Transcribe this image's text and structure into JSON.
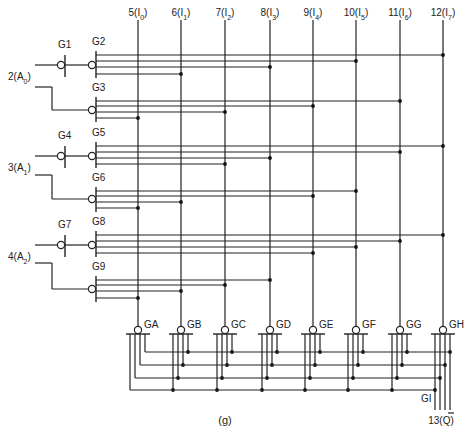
{
  "diagram": {
    "caption": "(g)",
    "type": "8-input multiplexer logic diagram",
    "colors": {
      "line": "#222222",
      "background": "#ffffff"
    }
  },
  "inputs_top": [
    {
      "pin": "5",
      "signal": "I",
      "sub": "0",
      "x": 138
    },
    {
      "pin": "6",
      "signal": "I",
      "sub": "1",
      "x": 181
    },
    {
      "pin": "7",
      "signal": "I",
      "sub": "2",
      "x": 225
    },
    {
      "pin": "8",
      "signal": "I",
      "sub": "3",
      "x": 270
    },
    {
      "pin": "9",
      "signal": "I",
      "sub": "4",
      "x": 313
    },
    {
      "pin": "10",
      "signal": "I",
      "sub": "5",
      "x": 356
    },
    {
      "pin": "11",
      "signal": "I",
      "sub": "6",
      "x": 400
    },
    {
      "pin": "12",
      "signal": "I",
      "sub": "7",
      "x": 443
    }
  ],
  "address_inputs": [
    {
      "pin": "2",
      "signal": "A",
      "sub": "0"
    },
    {
      "pin": "3",
      "signal": "A",
      "sub": "1"
    },
    {
      "pin": "4",
      "signal": "A",
      "sub": "2"
    }
  ],
  "inverter_gates": [
    "G1",
    "G4",
    "G7"
  ],
  "decoder_gates": [
    "G2",
    "G3",
    "G5",
    "G6",
    "G8",
    "G9"
  ],
  "output_gates": [
    "GA",
    "GB",
    "GC",
    "GD",
    "GE",
    "GF",
    "GG",
    "GH"
  ],
  "final_gate": "GI",
  "output": {
    "pin": "13",
    "signal": "Q",
    "overbar": true
  }
}
